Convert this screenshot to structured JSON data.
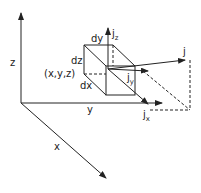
{
  "diagram": {
    "type": "vector decomposition of current density on a volume element",
    "axes": {
      "x_label": "x",
      "y_label": "y",
      "z_label": "z"
    },
    "element": {
      "dx_label": "dx",
      "dy_label": "dy",
      "dz_label": "dz",
      "point_label": "(x,y,z)"
    },
    "vectors": {
      "j_label": "j",
      "jx_main": "j",
      "jx_sub": "x",
      "jy_main": "j",
      "jy_sub": "y",
      "jz_main": "j",
      "jz_sub": "z"
    },
    "colors": {
      "stroke": "#222222",
      "background": "#ffffff"
    }
  }
}
